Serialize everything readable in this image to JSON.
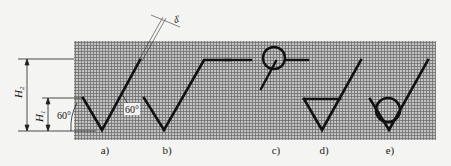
{
  "figure": {
    "type": "surface-roughness-symbol-proportions",
    "colors": {
      "background": "#f4f4f2",
      "grid_fill": "#b9b9b9",
      "grid_line": "#6e6e6e",
      "stroke": "#111111",
      "annotation": "#222222"
    },
    "dimensions": {
      "h2_label": "H",
      "h2_subscript": "2",
      "h1_label": "H",
      "h1_subscript": "1",
      "angle_left": "60°",
      "angle_right": "60°",
      "line_width_label": "d′"
    },
    "captions": [
      {
        "id": "a",
        "text": "a)"
      },
      {
        "id": "b",
        "text": "b)"
      },
      {
        "id": "c",
        "text": "c)"
      },
      {
        "id": "d",
        "text": "d)"
      },
      {
        "id": "e",
        "text": "e)"
      }
    ],
    "symbols": [
      {
        "id": "a",
        "description": "basic surface texture symbol (check mark with 60° legs)"
      },
      {
        "id": "b",
        "description": "extended symbol with horizontal bar"
      },
      {
        "id": "c",
        "description": "all-around circle on extension bar"
      },
      {
        "id": "d",
        "description": "symbol requiring material removal (bar closing triangle)"
      },
      {
        "id": "e",
        "description": "symbol prohibiting material removal (inscribed circle)"
      }
    ]
  }
}
